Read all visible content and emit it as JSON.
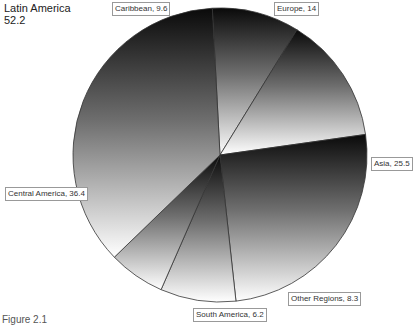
{
  "title": {
    "line1": "Latin America",
    "line2": "52.2"
  },
  "caption": "Figure 2.1",
  "chart_data": {
    "type": "pie",
    "title": "Latin America 52.2",
    "categories": [
      "Caribbean",
      "Europe",
      "Asia",
      "Other Regions",
      "South America",
      "Central America"
    ],
    "values": [
      9.6,
      14,
      25.5,
      8.3,
      6.2,
      36.4
    ],
    "labels": [
      "Caribbean, 9.6",
      "Europe, 14",
      "Asia, 25.5",
      "Other Regions, 8.3",
      "South America, 6.2",
      "Central America, 36.4"
    ],
    "start_angle_deg": -3,
    "direction": "clockwise",
    "fill": "vertical gradient black-to-white per slice",
    "legend": "none (data labels)"
  },
  "labels": {
    "caribbean": "Caribbean, 9.6",
    "europe": "Europe, 14",
    "asia": "Asia, 25.5",
    "other": "Other Regions, 8.3",
    "south_america": "South America, 6.2",
    "central_america": "Central America, 36.4"
  }
}
